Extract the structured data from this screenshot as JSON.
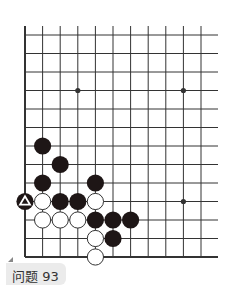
{
  "problem": {
    "label": "问题 93"
  },
  "board": {
    "grid": {
      "x0": 25,
      "dx": 17.6,
      "y0": 35,
      "dy": 18.5,
      "cols": 11,
      "rows": 13,
      "right_edge_x": 218,
      "top_extend_y": 26,
      "left_edge_bold": true,
      "bottom_edge_bold": true
    },
    "star_points": [
      {
        "col": 3,
        "row": 3
      },
      {
        "col": 9,
        "row": 3
      },
      {
        "col": 9,
        "row": 9
      }
    ],
    "stones": [
      {
        "color": "black",
        "col": 1,
        "row": 6
      },
      {
        "color": "black",
        "col": 2,
        "row": 7
      },
      {
        "color": "black",
        "col": 1,
        "row": 8
      },
      {
        "color": "black",
        "col": 4,
        "row": 8
      },
      {
        "color": "black",
        "col": 0,
        "row": 9,
        "marker": "triangle"
      },
      {
        "color": "white",
        "col": 1,
        "row": 9
      },
      {
        "color": "black",
        "col": 2,
        "row": 9
      },
      {
        "color": "black",
        "col": 3,
        "row": 9
      },
      {
        "color": "white",
        "col": 4,
        "row": 9
      },
      {
        "color": "white",
        "col": 1,
        "row": 10
      },
      {
        "color": "white",
        "col": 2,
        "row": 10
      },
      {
        "color": "white",
        "col": 3,
        "row": 10
      },
      {
        "color": "black",
        "col": 4,
        "row": 10
      },
      {
        "color": "black",
        "col": 5,
        "row": 10
      },
      {
        "color": "black",
        "col": 6,
        "row": 10
      },
      {
        "color": "white",
        "col": 4,
        "row": 11
      },
      {
        "color": "black",
        "col": 5,
        "row": 11
      },
      {
        "color": "white",
        "col": 4,
        "row": 12
      }
    ],
    "colors": {
      "line": "#333333",
      "black_stone": "#1e1616",
      "white_stone": "#ffffff",
      "white_stroke": "#333333",
      "marker": "#ffffff"
    }
  }
}
